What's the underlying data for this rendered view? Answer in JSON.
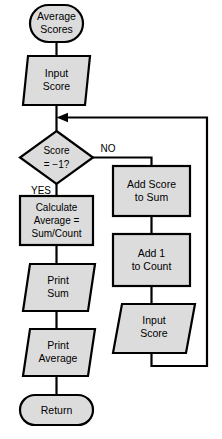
{
  "diagram": {
    "type": "flowchart",
    "colors": {
      "node_fill": "#dcdcdc",
      "stroke": "#000000",
      "background": "#ffffff"
    },
    "nodes": {
      "start": {
        "shape": "terminator",
        "line1": "Average",
        "line2": "Scores"
      },
      "input_score_1": {
        "shape": "parallelogram",
        "line1": "Input",
        "line2": "Score"
      },
      "decision": {
        "shape": "diamond",
        "line1": "Score",
        "line2": "= −1?"
      },
      "calculate_average": {
        "shape": "rectangle",
        "line1": "Calculate",
        "line2": "Average  =",
        "line3": "Sum/Count"
      },
      "print_sum": {
        "shape": "parallelogram",
        "line1": "Print",
        "line2": "Sum"
      },
      "print_average": {
        "shape": "parallelogram",
        "line1": "Print",
        "line2": "Average"
      },
      "return": {
        "shape": "terminator",
        "line1": "Return"
      },
      "add_score_to_sum": {
        "shape": "rectangle",
        "line1": "Add Score",
        "line2": "to Sum"
      },
      "add_1_to_count": {
        "shape": "rectangle",
        "line1": "Add 1",
        "line2": "to Count"
      },
      "input_score_2": {
        "shape": "parallelogram",
        "line1": "Input",
        "line2": "Score"
      }
    },
    "branch_labels": {
      "yes": "YES",
      "no": "NO"
    }
  }
}
